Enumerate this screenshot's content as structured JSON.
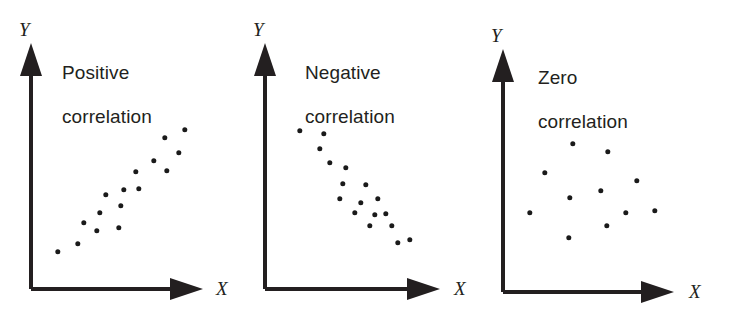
{
  "figure": {
    "width": 731,
    "height": 316,
    "background": "#ffffff",
    "ink_color": "#231f20",
    "dot_color": "#1a1a1a"
  },
  "chart_data": [
    {
      "type": "scatter",
      "title": "Positive\ncorrelation",
      "title_line1": "Positive",
      "title_line2": "correlation",
      "xlabel": "X",
      "ylabel": "Y",
      "grid": false,
      "legend": "none",
      "axis_ticks": [],
      "xlim": [
        0,
        100
      ],
      "ylim": [
        0,
        100
      ],
      "relationship": "positive",
      "n_points": 16,
      "points": [
        {
          "x": 16.0,
          "y": 21.5
        },
        {
          "x": 27.8,
          "y": 28.5
        },
        {
          "x": 36.0,
          "y": 37.0
        },
        {
          "x": 42.0,
          "y": 46.5
        },
        {
          "x": 31.8,
          "y": 50.5
        },
        {
          "x": 48.0,
          "y": 45.0
        },
        {
          "x": 55.0,
          "y": 41.0
        },
        {
          "x": 39.8,
          "y": 60.0
        },
        {
          "x": 51.0,
          "y": 61.5
        },
        {
          "x": 57.5,
          "y": 53.5
        },
        {
          "x": 61.5,
          "y": 66.5
        },
        {
          "x": 72.0,
          "y": 66.0
        },
        {
          "x": 79.5,
          "y": 73.0
        },
        {
          "x": 85.0,
          "y": 61.0
        },
        {
          "x": 87.5,
          "y": 81.0
        },
        {
          "x": 99.0,
          "y": 85.0
        }
      ],
      "pixel_points": [
        [
          58,
          252
        ],
        [
          78,
          244
        ],
        [
          84,
          223
        ],
        [
          97,
          231
        ],
        [
          100,
          213
        ],
        [
          106,
          195
        ],
        [
          119,
          228
        ],
        [
          121,
          206
        ],
        [
          124,
          190
        ],
        [
          136,
          172
        ],
        [
          139,
          189
        ],
        [
          154,
          161
        ],
        [
          165,
          138
        ],
        [
          167,
          171
        ],
        [
          179,
          153
        ],
        [
          185,
          130
        ]
      ]
    },
    {
      "type": "scatter",
      "title": "Negative\ncorrelation",
      "title_line1": "Negative",
      "title_line2": "correlation",
      "xlabel": "X",
      "ylabel": "Y",
      "grid": false,
      "legend": "none",
      "axis_ticks": [],
      "xlim": [
        0,
        100
      ],
      "ylim": [
        0,
        100
      ],
      "relationship": "negative",
      "n_points": 17,
      "points": [
        {
          "x": 20.5,
          "y": 86.5
        },
        {
          "x": 33.5,
          "y": 85.0
        },
        {
          "x": 31.5,
          "y": 75.5
        },
        {
          "x": 37.0,
          "y": 66.0
        },
        {
          "x": 46.5,
          "y": 62.5
        },
        {
          "x": 45.0,
          "y": 52.5
        },
        {
          "x": 58.0,
          "y": 52.0
        },
        {
          "x": 43.5,
          "y": 45.0
        },
        {
          "x": 64.5,
          "y": 49.5
        },
        {
          "x": 53.5,
          "y": 39.5
        },
        {
          "x": 49.5,
          "y": 34.0
        },
        {
          "x": 60.5,
          "y": 32.5
        },
        {
          "x": 66.5,
          "y": 31.0
        },
        {
          "x": 59.0,
          "y": 23.5
        },
        {
          "x": 71.5,
          "y": 24.0
        },
        {
          "x": 80.5,
          "y": 16.0
        },
        {
          "x": 74.0,
          "y": 14.0
        }
      ],
      "pixel_points": [
        [
          300,
          131
        ],
        [
          324,
          134
        ],
        [
          320,
          149
        ],
        [
          330,
          163
        ],
        [
          346,
          168
        ],
        [
          343,
          184
        ],
        [
          366,
          185
        ],
        [
          340,
          199
        ],
        [
          378,
          199
        ],
        [
          361,
          203
        ],
        [
          355,
          213
        ],
        [
          375,
          215
        ],
        [
          386,
          214
        ],
        [
          370,
          226
        ],
        [
          392,
          226
        ],
        [
          410,
          240
        ],
        [
          398,
          243
        ]
      ]
    },
    {
      "type": "scatter",
      "title": "Zero\ncorrelation",
      "title_line1": "Zero",
      "title_line2": "correlation",
      "xlabel": "X",
      "ylabel": "Y",
      "grid": false,
      "legend": "none",
      "axis_ticks": [],
      "xlim": [
        0,
        100
      ],
      "ylim": [
        0,
        100
      ],
      "relationship": "zero",
      "n_points": 11,
      "points": [
        {
          "x": 17.5,
          "y": 41.0
        },
        {
          "x": 27.0,
          "y": 62.5
        },
        {
          "x": 44.5,
          "y": 79.5
        },
        {
          "x": 43.5,
          "y": 50.5
        },
        {
          "x": 42.0,
          "y": 26.5
        },
        {
          "x": 61.5,
          "y": 32.0
        },
        {
          "x": 64.5,
          "y": 54.0
        },
        {
          "x": 71.0,
          "y": 74.0
        },
        {
          "x": 77.5,
          "y": 41.0
        },
        {
          "x": 85.5,
          "y": 61.0
        },
        {
          "x": 92.0,
          "y": 42.5
        }
      ],
      "pixel_points": [
        [
          530,
          213
        ],
        [
          545,
          173
        ],
        [
          573,
          144
        ],
        [
          570,
          198
        ],
        [
          569,
          238
        ],
        [
          607,
          226
        ],
        [
          601,
          191
        ],
        [
          608,
          152
        ],
        [
          626,
          213
        ],
        [
          637,
          181
        ],
        [
          655,
          211
        ]
      ]
    }
  ],
  "panels": [
    {
      "name": "positive-correlation",
      "title_line1": "Positive",
      "title_line2": "correlation",
      "xlabel": "X",
      "ylabel": "Y"
    },
    {
      "name": "negative-correlation",
      "title_line1": "Negative",
      "title_line2": "correlation",
      "xlabel": "X",
      "ylabel": "Y"
    },
    {
      "name": "zero-correlation",
      "title_line1": "Zero",
      "title_line2": "correlation",
      "xlabel": "X",
      "ylabel": "Y"
    }
  ]
}
